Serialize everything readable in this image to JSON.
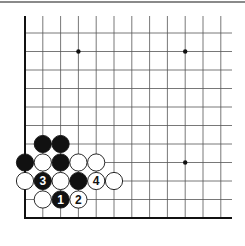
{
  "diagram": {
    "type": "go-board-corner",
    "view": "lower-left corner",
    "columns": 12,
    "rows": 11,
    "star_points": [
      [
        3,
        3
      ],
      [
        9,
        3
      ],
      [
        3,
        9
      ],
      [
        9,
        9
      ]
    ],
    "stones": [
      {
        "color": "black",
        "col": 1,
        "row": 4,
        "label": ""
      },
      {
        "color": "black",
        "col": 2,
        "row": 4,
        "label": ""
      },
      {
        "color": "black",
        "col": 0,
        "row": 3,
        "label": ""
      },
      {
        "color": "white",
        "col": 1,
        "row": 3,
        "label": ""
      },
      {
        "color": "black",
        "col": 2,
        "row": 3,
        "label": ""
      },
      {
        "color": "white",
        "col": 3,
        "row": 3,
        "label": ""
      },
      {
        "color": "white",
        "col": 4,
        "row": 3,
        "label": ""
      },
      {
        "color": "white",
        "col": 0,
        "row": 2,
        "label": ""
      },
      {
        "color": "black",
        "col": 1,
        "row": 2,
        "label": "3"
      },
      {
        "color": "white",
        "col": 2,
        "row": 2,
        "label": ""
      },
      {
        "color": "black",
        "col": 3,
        "row": 2,
        "label": ""
      },
      {
        "color": "white",
        "col": 4,
        "row": 2,
        "label": "4"
      },
      {
        "color": "white",
        "col": 5,
        "row": 2,
        "label": ""
      },
      {
        "color": "white",
        "col": 1,
        "row": 1,
        "label": ""
      },
      {
        "color": "black",
        "col": 2,
        "row": 1,
        "label": "1"
      },
      {
        "color": "white",
        "col": 3,
        "row": 1,
        "label": "2"
      }
    ]
  }
}
